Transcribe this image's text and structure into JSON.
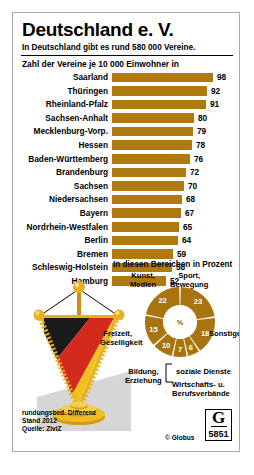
{
  "poster": {
    "title": "Deutschland e. V.",
    "subtitle": "In Deutschland gibt es rund 580 000 Vereine.",
    "bar_heading": "Zahl der Vereine je 10 000 Einwohner in",
    "pie_heading": "In diesen Bereichen in Prozent"
  },
  "footer": {
    "note1": "rundungsbed. Differenz",
    "note2": "Stand 2012",
    "note3": "Quelle: ZiviZ",
    "copyright": "© Globus",
    "logo_letter": "G",
    "logo_number": "5851"
  },
  "colors": {
    "bar": "#b0790f",
    "donut": "#a8740f",
    "flag_black": "#1a1a1a",
    "flag_red": "#d42a1e",
    "flag_gold": "#f2c021",
    "fringe": "#e8b020"
  },
  "chart_data": [
    {
      "type": "bar",
      "title": "Zahl der Vereine je 10 000 Einwohner in",
      "xlabel": "",
      "ylabel": "",
      "orientation": "horizontal",
      "xlim": [
        0,
        98
      ],
      "grid": false,
      "categories": [
        "Saarland",
        "Thüringen",
        "Rheinland-Pfalz",
        "Sachsen-Anhalt",
        "Mecklenburg-Vorp.",
        "Hessen",
        "Baden-Württemberg",
        "Brandenburg",
        "Sachsen",
        "Niedersachsen",
        "Bayern",
        "Nordrhein-Westfalen",
        "Berlin",
        "Bremen",
        "Schleswig-Holstein",
        "Hamburg"
      ],
      "values": [
        98,
        92,
        91,
        80,
        79,
        78,
        76,
        72,
        70,
        68,
        67,
        65,
        64,
        59,
        58,
        52
      ]
    },
    {
      "type": "pie",
      "title": "In diesen Bereichen in Prozent",
      "unit": "%",
      "center_label": "%",
      "labels": [
        "Sport, Bewegung",
        "Sonstiges",
        "soziale Dienste",
        "Wirtschafts- u. Berufsverbände",
        "Bildung, Erziehung",
        "Freizeit, Geselligkeit",
        "Kunst, Medien"
      ],
      "values": [
        23,
        18,
        6,
        7,
        10,
        15,
        22
      ]
    }
  ]
}
